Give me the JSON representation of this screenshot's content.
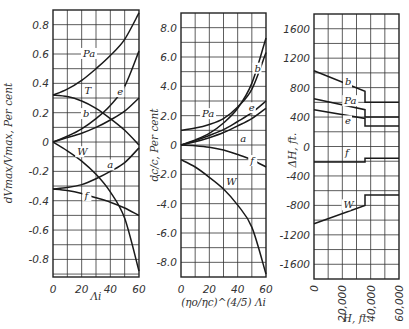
{
  "chart_data": [
    {
      "type": "line",
      "panel": "left",
      "title": "",
      "xlabel": "Λi",
      "ylabel": "dVmax/Vmax, Per cent",
      "xlim": [
        0,
        60
      ],
      "ylim": [
        -0.92,
        0.9
      ],
      "xticks": [
        0,
        20,
        40,
        60
      ],
      "yticks": [
        0.8,
        0.6,
        0.4,
        0.2,
        0,
        -0.2,
        -0.4,
        -0.6,
        -0.8
      ],
      "ytick_labels": [
        "0.8",
        "0.6",
        "0.4",
        "0.2",
        "0",
        "-0.2",
        "-0.4",
        "-0.6",
        "-0.8"
      ],
      "grid": true,
      "x": [
        0,
        10,
        20,
        30,
        40,
        50,
        60
      ],
      "series": [
        {
          "name": "Pa",
          "values": [
            0.32,
            0.36,
            0.42,
            0.5,
            0.59,
            0.7,
            0.88
          ]
        },
        {
          "name": "T",
          "values": [
            0.32,
            0.31,
            0.28,
            0.23,
            0.16,
            0.08,
            -0.02
          ]
        },
        {
          "name": "e",
          "values": [
            0.0,
            0.04,
            0.09,
            0.16,
            0.25,
            0.38,
            0.62
          ]
        },
        {
          "name": "b",
          "values": [
            0.0,
            0.03,
            0.06,
            0.1,
            0.15,
            0.21,
            0.3
          ]
        },
        {
          "name": "W",
          "values": [
            0.0,
            -0.06,
            -0.13,
            -0.22,
            -0.34,
            -0.52,
            -0.88
          ]
        },
        {
          "name": "a",
          "values": [
            -0.32,
            -0.31,
            -0.29,
            -0.25,
            -0.2,
            -0.14,
            -0.04
          ]
        },
        {
          "name": "f",
          "values": [
            -0.32,
            -0.33,
            -0.35,
            -0.38,
            -0.41,
            -0.45,
            -0.5
          ]
        }
      ],
      "curve_labels": [
        {
          "text": "Pa",
          "x": 23,
          "y": 0.58
        },
        {
          "text": "T",
          "x": 24,
          "y": 0.33
        },
        {
          "text": "e",
          "x": 47,
          "y": 0.32
        },
        {
          "text": "b",
          "x": 23,
          "y": 0.17
        },
        {
          "text": "W",
          "x": 19,
          "y": -0.09
        },
        {
          "text": "a",
          "x": 40,
          "y": -0.18
        },
        {
          "text": "f",
          "x": 24,
          "y": -0.39
        }
      ]
    },
    {
      "type": "line",
      "panel": "middle",
      "title": "",
      "xlabel": "(ηo/ηc)^(4/5) Λi",
      "ylabel": "dc/c, Per cent",
      "xlim": [
        0,
        60
      ],
      "ylim": [
        -9.0,
        9.0
      ],
      "xticks": [
        0,
        20,
        40,
        60
      ],
      "yticks": [
        8,
        6,
        4,
        2,
        0,
        -2,
        -4,
        -6,
        -8
      ],
      "ytick_labels": [
        "8.0",
        "6.0",
        "4.0",
        "2.0",
        "0",
        "-2.0",
        "-4.0",
        "-6.0",
        "-8.0"
      ],
      "grid": true,
      "x": [
        0,
        10,
        20,
        30,
        40,
        50,
        60
      ],
      "series": [
        {
          "name": "b",
          "values": [
            0.0,
            0.35,
            0.8,
            1.5,
            2.5,
            4.2,
            7.3
          ]
        },
        {
          "name": "Pa",
          "values": [
            1.0,
            1.15,
            1.4,
            1.8,
            2.6,
            3.8,
            6.3
          ]
        },
        {
          "name": "e",
          "values": [
            0.0,
            0.3,
            0.65,
            1.05,
            1.6,
            2.2,
            3.0
          ]
        },
        {
          "name": "a",
          "values": [
            0.0,
            0.22,
            0.5,
            0.85,
            1.3,
            1.8,
            2.5
          ]
        },
        {
          "name": "f",
          "values": [
            0.0,
            -0.05,
            -0.15,
            -0.35,
            -0.65,
            -1.0,
            -1.5
          ]
        },
        {
          "name": "W",
          "values": [
            -1.0,
            -1.5,
            -2.2,
            -3.0,
            -4.1,
            -5.6,
            -8.8
          ]
        }
      ],
      "curve_labels": [
        {
          "text": "b",
          "x": 54,
          "y": 5.0
        },
        {
          "text": "Pa",
          "x": 17,
          "y": 1.9
        },
        {
          "text": "e",
          "x": 50,
          "y": 2.3
        },
        {
          "text": "a",
          "x": 44,
          "y": 0.2
        },
        {
          "text": "f",
          "x": 51,
          "y": -1.3
        },
        {
          "text": "W",
          "x": 34,
          "y": -2.7
        }
      ]
    },
    {
      "type": "line",
      "panel": "right",
      "title": "",
      "xlabel": "H, ft.",
      "ylabel": "ΔH, ft.",
      "xlim": [
        0,
        60000
      ],
      "ylim": [
        -1800,
        1800
      ],
      "xticks": [
        0,
        20000,
        40000,
        60000
      ],
      "xtick_labels": [
        "0",
        "20,000",
        "40,000",
        "60,000"
      ],
      "yticks": [
        1600,
        1200,
        800,
        400,
        0,
        -400,
        -800,
        -1200,
        -1600
      ],
      "ytick_labels": [
        "1600",
        "1200",
        "800",
        "400",
        "0",
        "-400",
        "-800",
        "-1200",
        "-1600"
      ],
      "grid": true,
      "series": [
        {
          "name": "b",
          "x": [
            0,
            36000,
            36000,
            60000
          ],
          "values": [
            1030,
            750,
            600,
            600
          ]
        },
        {
          "name": "Pa",
          "x": [
            0,
            36000,
            36000,
            60000
          ],
          "values": [
            650,
            500,
            400,
            400
          ]
        },
        {
          "name": "e",
          "x": [
            0,
            36000,
            36000,
            60000
          ],
          "values": [
            500,
            380,
            280,
            280
          ]
        },
        {
          "name": "f",
          "x": [
            0,
            36000,
            36000,
            60000
          ],
          "values": [
            -210,
            -210,
            -160,
            -160
          ]
        },
        {
          "name": "W",
          "x": [
            0,
            36000,
            36000,
            60000
          ],
          "values": [
            -1050,
            -800,
            -660,
            -660
          ]
        }
      ],
      "curve_labels": [
        {
          "text": "b",
          "x": 24000,
          "y": 830
        },
        {
          "text": "Pa",
          "x": 23500,
          "y": 575
        },
        {
          "text": "e",
          "x": 24000,
          "y": 300
        },
        {
          "text": "f",
          "x": 24000,
          "y": -130
        },
        {
          "text": "W",
          "x": 23000,
          "y": -840
        }
      ]
    }
  ]
}
